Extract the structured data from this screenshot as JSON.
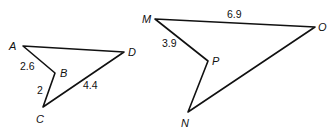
{
  "figures": [
    {
      "name": "quadrilateral-ABCD",
      "vertices": {
        "A": {
          "label": "A",
          "x": 23,
          "y": 46,
          "lx": 9,
          "ly": 50
        },
        "B": {
          "label": "B",
          "x": 55,
          "y": 73,
          "lx": 60,
          "ly": 77
        },
        "C": {
          "label": "C",
          "x": 43,
          "y": 107,
          "lx": 36,
          "ly": 123
        },
        "D": {
          "label": "D",
          "x": 124,
          "y": 52,
          "lx": 128,
          "ly": 56
        }
      },
      "edges": [
        {
          "from": "A",
          "to": "D",
          "length": ""
        },
        {
          "from": "A",
          "to": "B",
          "length": "2.6",
          "lx": 20,
          "ly": 70
        },
        {
          "from": "B",
          "to": "C",
          "length": "2",
          "lx": 37,
          "ly": 94
        },
        {
          "from": "C",
          "to": "D",
          "length": "4.4",
          "lx": 83,
          "ly": 89
        }
      ]
    },
    {
      "name": "quadrilateral-MPNO",
      "vertices": {
        "M": {
          "label": "M",
          "x": 155,
          "y": 19,
          "lx": 142,
          "ly": 23
        },
        "P": {
          "label": "P",
          "x": 208,
          "y": 61,
          "lx": 212,
          "ly": 65
        },
        "N": {
          "label": "N",
          "x": 188,
          "y": 112,
          "lx": 181,
          "ly": 127
        },
        "O": {
          "label": "O",
          "x": 315,
          "y": 27,
          "lx": 318,
          "ly": 31
        }
      },
      "edges": [
        {
          "from": "M",
          "to": "O",
          "length": "6.9",
          "lx": 227,
          "ly": 18
        },
        {
          "from": "M",
          "to": "P",
          "length": "3.9",
          "lx": 162,
          "ly": 47
        },
        {
          "from": "P",
          "to": "N",
          "length": ""
        },
        {
          "from": "N",
          "to": "O",
          "length": ""
        }
      ]
    }
  ],
  "labels": {
    "A": "A",
    "B": "B",
    "C": "C",
    "D": "D",
    "M": "M",
    "N": "N",
    "O": "O",
    "P": "P",
    "AB": "2.6",
    "BC": "2",
    "CD": "4.4",
    "MO": "6.9",
    "MP": "3.9"
  }
}
